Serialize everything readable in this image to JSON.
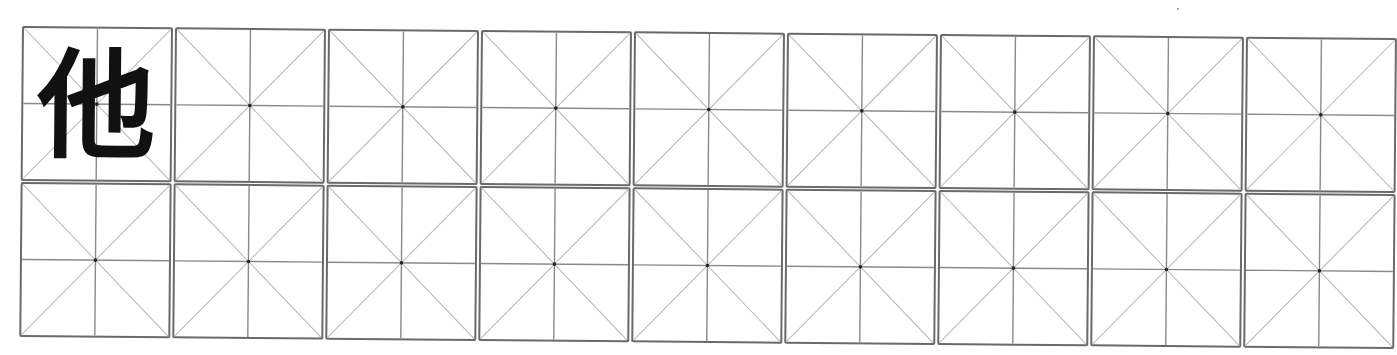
{
  "worksheet": {
    "type": "mi-zi-ge practice grid",
    "rows": 2,
    "columns": 9,
    "colors": {
      "border": "#6a6a6a",
      "center_lines": "#8a8a8a",
      "diagonals": "#b5b5b5",
      "center_dot": "#222222",
      "character": "#111111"
    },
    "cells": [
      [
        {
          "char": "他"
        },
        {
          "char": ""
        },
        {
          "char": ""
        },
        {
          "char": ""
        },
        {
          "char": ""
        },
        {
          "char": ""
        },
        {
          "char": ""
        },
        {
          "char": ""
        },
        {
          "char": ""
        }
      ],
      [
        {
          "char": ""
        },
        {
          "char": ""
        },
        {
          "char": ""
        },
        {
          "char": ""
        },
        {
          "char": ""
        },
        {
          "char": ""
        },
        {
          "char": ""
        },
        {
          "char": ""
        },
        {
          "char": ""
        }
      ]
    ]
  }
}
